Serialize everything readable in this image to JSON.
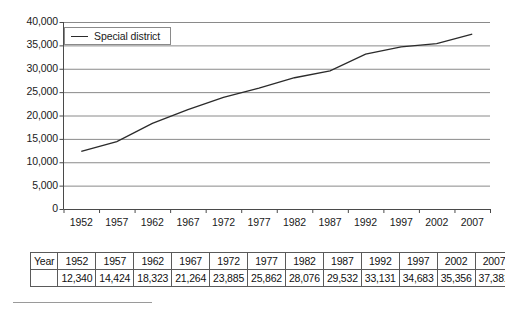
{
  "chart_data": {
    "type": "line",
    "title": "",
    "xlabel": "",
    "ylabel": "",
    "categories": [
      "1952",
      "1957",
      "1962",
      "1967",
      "1972",
      "1977",
      "1982",
      "1987",
      "1992",
      "1997",
      "2002",
      "2007"
    ],
    "x": [
      1952,
      1957,
      1962,
      1967,
      1972,
      1977,
      1982,
      1987,
      1992,
      1997,
      2002,
      2007
    ],
    "series": [
      {
        "name": "Special district",
        "values": [
          12340,
          14424,
          18323,
          21264,
          23885,
          25862,
          28076,
          29532,
          33131,
          34683,
          35356,
          37381
        ]
      }
    ],
    "ylim": [
      0,
      40000
    ],
    "yticks": [
      0,
      5000,
      10000,
      15000,
      20000,
      25000,
      30000,
      35000,
      40000
    ],
    "ytick_labels": [
      "0",
      "5,000",
      "10,000",
      "15,000",
      "20,000",
      "25,000",
      "30,000",
      "35,000",
      "40,000"
    ],
    "xtick_labels": [
      "1952",
      "1957",
      "1962",
      "1967",
      "1972",
      "1977",
      "1982",
      "1987",
      "1992",
      "1997",
      "2002",
      "2007"
    ],
    "grid": "horizontal",
    "legend_position": "top-left",
    "line_color": "#2b2b2b",
    "grid_color": "#8a8a8a",
    "axis_color": "#4a4a4a"
  },
  "legend": {
    "label": "Special district"
  },
  "table": {
    "row_label": "Year",
    "years": [
      "1952",
      "1957",
      "1962",
      "1967",
      "1972",
      "1977",
      "1982",
      "1987",
      "1992",
      "1997",
      "2002",
      "2007"
    ],
    "values": [
      "12,340",
      "14,424",
      "18,323",
      "21,264",
      "23,885",
      "25,862",
      "28,076",
      "29,532",
      "33,131",
      "34,683",
      "35,356",
      "37,381"
    ],
    "values_row_label": ""
  }
}
